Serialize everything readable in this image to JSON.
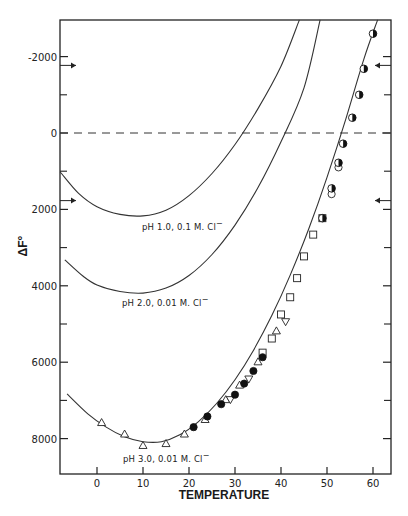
{
  "chart_data": {
    "type": "line",
    "title": "",
    "xlabel": "TEMPERATURE",
    "ylabel": "ΔF°",
    "xlim": [
      -8,
      64
    ],
    "ylim": [
      8940,
      -2970
    ],
    "y_inverted": true,
    "grid": false,
    "x_ticks": [
      0,
      10,
      20,
      30,
      40,
      50,
      60
    ],
    "y_ticks": [
      -2000,
      0,
      2000,
      4000,
      6000,
      8000
    ],
    "y_tick_labels": [
      "-2000",
      "0",
      "2000",
      "4000",
      "6000",
      "8000"
    ],
    "y_minor_ticks": [
      -1000,
      1000,
      3000,
      5000,
      7000
    ],
    "reference_line": {
      "y": 0,
      "style": "dashed"
    },
    "arrows": [
      {
        "side": "left",
        "y": -1770
      },
      {
        "side": "left",
        "y": 1770
      },
      {
        "side": "right",
        "y": -1770
      },
      {
        "side": "right",
        "y": 1770
      }
    ],
    "series": [
      {
        "name": "pH 1.0, 0.1 M. Cl⁻",
        "label": "pH 1.0, 0.1 M. Cl",
        "type": "curve",
        "x": [
          -8,
          -4,
          0,
          5,
          10,
          15,
          20,
          25,
          30,
          35,
          40,
          44
        ],
        "y": [
          1020,
          1580,
          1930,
          2130,
          2170,
          2020,
          1640,
          1060,
          300,
          -640,
          -1750,
          -2960
        ]
      },
      {
        "name": "pH 2.0, 0.01 M. Cl⁻",
        "label": "pH 2.0, 0.01 M. Cl",
        "type": "curve",
        "x": [
          -7,
          -3,
          0,
          5,
          10,
          15,
          20,
          25,
          30,
          35,
          40,
          45,
          48.5
        ],
        "y": [
          3320,
          3750,
          3980,
          4150,
          4190,
          4060,
          3730,
          3180,
          2410,
          1430,
          230,
          -1180,
          -2960
        ]
      },
      {
        "name": "pH 3.0, 0.01 M. Cl⁻",
        "label": "pH 3.0, 0.01 M. Cl",
        "type": "curve",
        "x": [
          -6.5,
          -2,
          2,
          6,
          10,
          14,
          18,
          22,
          26,
          30,
          34,
          38,
          42,
          46,
          50,
          54,
          58,
          61
        ],
        "y": [
          6830,
          7350,
          7700,
          7950,
          8080,
          8080,
          7900,
          7560,
          7080,
          6460,
          5690,
          4780,
          3720,
          2520,
          1160,
          -330,
          -1930,
          -2960
        ]
      }
    ],
    "points": {
      "open_triangle": [
        {
          "x": 1,
          "y": 7580
        },
        {
          "x": 6,
          "y": 7880
        },
        {
          "x": 10,
          "y": 8180
        },
        {
          "x": 15,
          "y": 8130
        },
        {
          "x": 19,
          "y": 7880
        },
        {
          "x": 23.5,
          "y": 7500
        },
        {
          "x": 28,
          "y": 6980
        },
        {
          "x": 31,
          "y": 6600
        },
        {
          "x": 35,
          "y": 5990
        },
        {
          "x": 39,
          "y": 5180
        }
      ],
      "inverted_triangle": [
        {
          "x": 29,
          "y": 6980
        },
        {
          "x": 33,
          "y": 6440
        },
        {
          "x": 41,
          "y": 4940
        }
      ],
      "filled_circle": [
        {
          "x": 21,
          "y": 7700
        },
        {
          "x": 24,
          "y": 7420
        },
        {
          "x": 27,
          "y": 7100
        },
        {
          "x": 30,
          "y": 6850
        },
        {
          "x": 32,
          "y": 6560
        },
        {
          "x": 34,
          "y": 6230
        },
        {
          "x": 36,
          "y": 5870
        }
      ],
      "open_square": [
        {
          "x": 36,
          "y": 5750
        },
        {
          "x": 38,
          "y": 5380
        },
        {
          "x": 40,
          "y": 4750
        },
        {
          "x": 42,
          "y": 4300
        },
        {
          "x": 43.5,
          "y": 3800
        },
        {
          "x": 45,
          "y": 3230
        },
        {
          "x": 47,
          "y": 2660
        },
        {
          "x": 49,
          "y": 2230
        }
      ],
      "half_filled_circle": [
        {
          "x": 49,
          "y": 2230
        },
        {
          "x": 51,
          "y": 1450
        },
        {
          "x": 52.5,
          "y": 780
        },
        {
          "x": 53.5,
          "y": 280
        },
        {
          "x": 55.5,
          "y": -400
        },
        {
          "x": 57,
          "y": -1000
        },
        {
          "x": 58,
          "y": -1680
        },
        {
          "x": 60,
          "y": -2600
        }
      ],
      "open_circle": [
        {
          "x": 51,
          "y": 1600
        },
        {
          "x": 52.5,
          "y": 900
        }
      ]
    }
  },
  "labels": {
    "y_axis_title": "ΔF°",
    "x_axis_title": "TEMPERATURE",
    "curve_ph1": "pH 1.0, 0.1 M. Cl",
    "curve_ph2": "pH 2.0, 0.01 M. Cl",
    "curve_ph3": "pH 3.0, 0.01 M. Cl",
    "superscript_minus": "−"
  }
}
